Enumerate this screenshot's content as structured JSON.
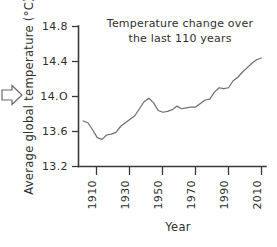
{
  "figure": {
    "background_color": "#ffffff",
    "line_color": "#6f6f6f",
    "axis_color": "#3a3a3a",
    "text_color": "#2f2f2f"
  },
  "annotation": {
    "arrow_icon": "right-arrow-outline",
    "arrow_label": "⇨"
  },
  "chart_data": {
    "type": "line",
    "title_lines": [
      "Temperature change over",
      "the last 110 years"
    ],
    "xlabel": "Year",
    "ylabel": "Average global temperature (°C)",
    "xlim": [
      1900,
      2020
    ],
    "ylim": [
      13.2,
      14.8
    ],
    "grid": false,
    "legend": "none",
    "xticks": [
      1910,
      1930,
      1950,
      1970,
      1990,
      2010
    ],
    "xtick_labels": [
      "1910",
      "1930",
      "1950",
      "1970",
      "1990",
      "2010"
    ],
    "xtick_rotation": 90,
    "yticks": [
      13.2,
      13.6,
      14.0,
      14.4,
      14.8
    ],
    "ytick_labels": [
      "13.2",
      "13.6",
      "14.O",
      "14.4",
      "14.8"
    ],
    "series": [
      {
        "name": "Average global temperature",
        "color": "#6f6f6f",
        "x": [
          1903,
          1906,
          1909,
          1912,
          1915,
          1918,
          1921,
          1924,
          1927,
          1930,
          1933,
          1936,
          1939,
          1942,
          1945,
          1948,
          1951,
          1954,
          1957,
          1960,
          1963,
          1966,
          1969,
          1972,
          1975,
          1978,
          1981,
          1984,
          1987,
          1990,
          1993,
          1996,
          1999,
          2002,
          2005,
          2008,
          2011,
          2014,
          2017
        ],
        "y": [
          13.72,
          13.7,
          13.62,
          13.53,
          13.51,
          13.56,
          13.57,
          13.59,
          13.66,
          13.7,
          13.74,
          13.78,
          13.86,
          13.94,
          13.98,
          13.93,
          13.84,
          13.82,
          13.83,
          13.85,
          13.89,
          13.86,
          13.87,
          13.88,
          13.88,
          13.92,
          13.96,
          13.97,
          14.05,
          14.1,
          14.09,
          14.1,
          14.18,
          14.22,
          14.28,
          14.33,
          14.38,
          14.42,
          14.44
        ]
      }
    ]
  }
}
